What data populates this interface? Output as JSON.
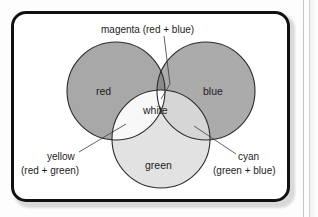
{
  "figure": {
    "kind": "venn-diagram",
    "frame_color": "#111111",
    "card_background": "#ffffff",
    "page_background": "#fdfdfd"
  },
  "circles": [
    {
      "id": "red",
      "label": "red",
      "fill": "#a8a8a8",
      "cx": 113,
      "cy": 88,
      "r": 49,
      "label_x": 93,
      "label_y": 82
    },
    {
      "id": "blue",
      "label": "blue",
      "fill": "#ababab",
      "cx": 203,
      "cy": 88,
      "r": 49,
      "label_x": 201,
      "label_y": 82
    },
    {
      "id": "green",
      "label": "green",
      "fill": "#e2e2e2",
      "cx": 158,
      "cy": 136,
      "r": 49,
      "label_x": 142,
      "label_y": 166
    }
  ],
  "overlaps": [
    {
      "id": "magenta",
      "label": "magenta (red + blue)",
      "fill": "#8a8a8a",
      "components": "red + blue"
    },
    {
      "id": "yellow",
      "label": "yellow",
      "sublabel": "(red + green)",
      "fill": "#f8f8f8",
      "components": "red + green"
    },
    {
      "id": "cyan",
      "label": "cyan",
      "sublabel": "(green + blue)",
      "fill": "#d6d6d6",
      "components": "green + blue"
    },
    {
      "id": "white",
      "label": "white",
      "fill": "#ffffff",
      "components": "red + green + blue",
      "label_x": 140,
      "label_y": 101
    }
  ],
  "callouts": {
    "magenta": {
      "text": "magenta (red + blue)",
      "text_x": 98,
      "text_y": 25
    },
    "yellow": {
      "line1": "yellow",
      "line2": "(red + green)",
      "line1_x": 44,
      "line1_y": 151,
      "line2_x": 18,
      "line2_y": 165
    },
    "cyan": {
      "line1": "cyan",
      "line2": "(green + blue)",
      "line1_x": 222,
      "line1_y": 151,
      "line2_x": 209,
      "line2_y": 165
    }
  },
  "scan_artifact": {
    "line_color": "#c4c4c4",
    "count": 2
  }
}
